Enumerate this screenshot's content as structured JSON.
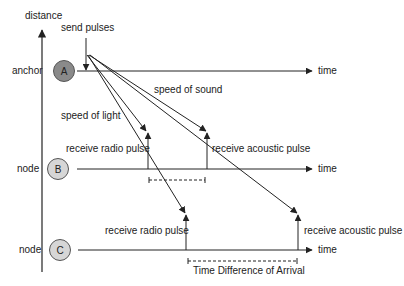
{
  "diagram": {
    "axes": {
      "vertical_label": "distance",
      "horizontal_label": "time"
    },
    "colors": {
      "line": "#222222",
      "anchor_fill": "#8a8a8a",
      "node_fill": "#d6d6d6",
      "background": "#ffffff"
    },
    "send_label": "send pulses",
    "rows": [
      {
        "role": "anchor",
        "id": "A",
        "time_label": "time"
      },
      {
        "role": "node",
        "id": "B",
        "time_label": "time"
      },
      {
        "role": "node",
        "id": "C",
        "time_label": "time"
      }
    ],
    "signals": {
      "light": "speed of light",
      "sound": "speed of sound"
    },
    "events": {
      "b_radio": "receive radio pulse",
      "b_acoustic": "receive acoustic pulse",
      "c_radio": "receive radio pulse",
      "c_acoustic": "receive acoustic pulse"
    },
    "tdoa_label": "Time Difference of Arrival"
  }
}
